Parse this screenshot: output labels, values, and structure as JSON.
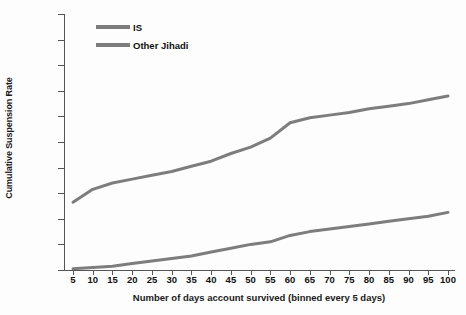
{
  "chart_data": {
    "type": "line",
    "title": "",
    "xlabel": "Number of days account survived (binned every 5 days)",
    "ylabel": "Cumulative Suspension Rate",
    "xlim": [
      5,
      100
    ],
    "ylim": [
      0,
      100
    ],
    "grid": false,
    "legend_position": "top-left",
    "x": [
      5,
      10,
      15,
      20,
      25,
      30,
      35,
      40,
      45,
      50,
      55,
      60,
      65,
      70,
      75,
      80,
      85,
      90,
      95,
      100
    ],
    "xtick_labels": [
      "5",
      "10",
      "15",
      "20",
      "25",
      "30",
      "35",
      "40",
      "45",
      "50",
      "55",
      "60",
      "65",
      "70",
      "75",
      "80",
      "85",
      "90",
      "95",
      "100"
    ],
    "ytick_labels": [
      "0%",
      "10%",
      "20%",
      "30%",
      "40%",
      "50%",
      "60%",
      "70%",
      "80%",
      "90%",
      "100%"
    ],
    "ytick_values": [
      0,
      10,
      20,
      30,
      40,
      50,
      60,
      70,
      80,
      90,
      100
    ],
    "series": [
      {
        "name": "IS",
        "color": "#7d7d7d",
        "values": [
          26.5,
          31.5,
          34.0,
          35.5,
          37.0,
          38.5,
          40.5,
          42.5,
          45.5,
          48.0,
          51.5,
          57.5,
          59.5,
          60.5,
          61.5,
          63.0,
          64.0,
          65.0,
          66.5,
          68.0
        ]
      },
      {
        "name": "Other Jihadi",
        "color": "#7d7d7d",
        "values": [
          0.5,
          1.0,
          1.5,
          2.5,
          3.5,
          4.5,
          5.5,
          7.0,
          8.5,
          10.0,
          11.0,
          13.5,
          15.0,
          16.0,
          17.0,
          18.0,
          19.0,
          20.0,
          21.0,
          22.5
        ]
      }
    ]
  },
  "legend": {
    "items": [
      {
        "label": "IS"
      },
      {
        "label": "Other Jihadi"
      }
    ]
  },
  "colors": {
    "line": "#7d7d7d",
    "axis": "#555555",
    "text": "#111111",
    "background": "#fdfdfd"
  }
}
